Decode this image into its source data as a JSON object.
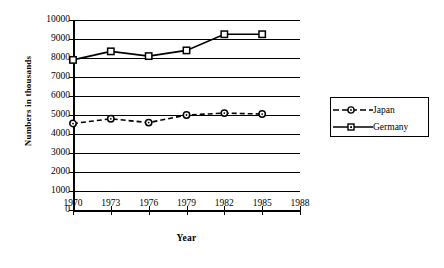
{
  "chart_data": {
    "type": "line",
    "title": "",
    "xlabel": "Year",
    "ylabel": "Numbers  in  thousands",
    "x": [
      1970,
      1973,
      1976,
      1979,
      1982,
      1985
    ],
    "x_ticks": [
      1970,
      1973,
      1976,
      1979,
      1982,
      1985,
      1988
    ],
    "xlim": [
      1970,
      1988
    ],
    "ylim": [
      0,
      10000
    ],
    "y_ticks": [
      0,
      1000,
      2000,
      3000,
      4000,
      5000,
      6000,
      7000,
      8000,
      9000,
      10000
    ],
    "grid": true,
    "legend_position": "right",
    "series": [
      {
        "name": "Japan",
        "values": [
          4550,
          4800,
          4600,
          5000,
          5100,
          5050
        ],
        "marker": "circle",
        "linestyle": "dashed",
        "color": "#000000"
      },
      {
        "name": "Germany",
        "values": [
          7900,
          8350,
          8100,
          8400,
          9250,
          9250
        ],
        "marker": "square",
        "linestyle": "solid",
        "color": "#000000"
      }
    ]
  },
  "axes": {
    "y_title": "Numbers  in  thousands",
    "x_title": "Year",
    "y_tick_labels": [
      "10000",
      "9000",
      "8000",
      "7000",
      "6000",
      "5000",
      "4000",
      "3000",
      "2000",
      "1000",
      "0"
    ],
    "x_tick_labels": [
      "1970",
      "1973",
      "1976",
      "1979",
      "1982",
      "1985",
      "1988"
    ]
  },
  "legend": {
    "items": [
      {
        "label": "Japan",
        "marker": "circle-marker",
        "line": "dashed-line"
      },
      {
        "label": "Germany",
        "marker": "square-marker",
        "line": "solid-line"
      }
    ]
  }
}
